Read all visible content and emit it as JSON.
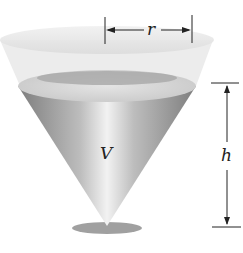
{
  "figure": {
    "labels": {
      "radius": "r",
      "volume": "V",
      "height": "h"
    },
    "colors": {
      "cone_rim": "#e6e6e6",
      "liquid_dark": "#8a8a8a",
      "liquid_light": "#d8d8d8",
      "shadow": "#9a9a9a",
      "line": "#222222"
    }
  }
}
